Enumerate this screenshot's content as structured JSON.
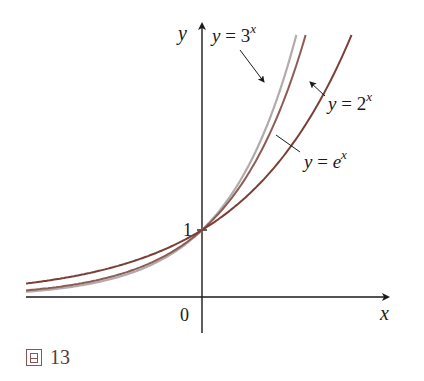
{
  "chart_data": {
    "type": "line",
    "title": "",
    "xlabel": "x",
    "ylabel": "y",
    "xlim": [
      -2.3,
      2.8
    ],
    "ylim": [
      -0.2,
      4.0
    ],
    "grid": false,
    "ticks": {
      "x": [
        {
          "value": 0,
          "label": "0"
        }
      ],
      "y": [
        {
          "value": 1,
          "label": "1"
        }
      ]
    },
    "series": [
      {
        "name": "y = 2^x",
        "label_base": "y = 2",
        "label_exp": "x",
        "base": 2,
        "color": "#7a3f36"
      },
      {
        "name": "y = e^x",
        "label_base": "y = e",
        "label_exp": "x",
        "base": 2.718281828,
        "color": "#8c5c56"
      },
      {
        "name": "y = 3^x",
        "label_base": "y = 3",
        "label_exp": "x",
        "base": 3,
        "color": "#b3aaaa"
      }
    ],
    "annotations": [
      {
        "text": "y = 3^x",
        "points_to": "y = 3^x curve"
      },
      {
        "text": "y = 2^x",
        "points_to": "y = 2^x curve"
      },
      {
        "text": "y = e^x",
        "points_to": "y = e^x curve"
      }
    ]
  },
  "caption": {
    "prefix": "圖",
    "number": "13"
  },
  "axes": {
    "x_label": "x",
    "y_label": "y",
    "origin_label": "0",
    "one_label": "1"
  },
  "colors": {
    "axis": "#1a1a1a",
    "caption": "#5a3a38"
  }
}
